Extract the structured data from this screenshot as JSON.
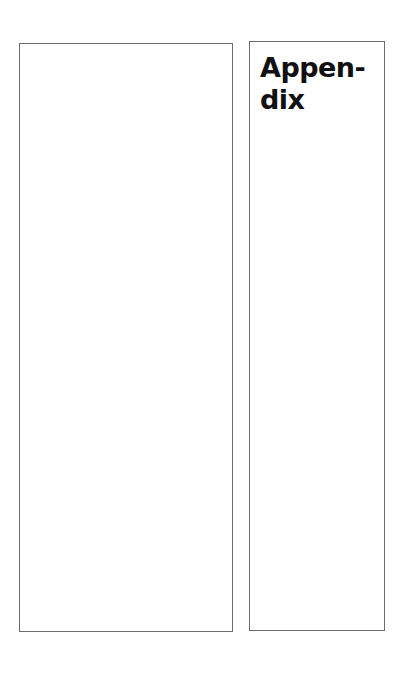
{
  "page": {
    "left_panel": {},
    "right_panel": {
      "title": "Appen-\ndix"
    }
  }
}
